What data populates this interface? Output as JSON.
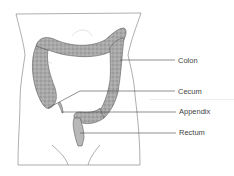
{
  "diagram": {
    "labels": [
      {
        "id": "colon",
        "text": "Colon",
        "x": 178,
        "y": 57
      },
      {
        "id": "cecum",
        "text": "Cecum",
        "x": 178,
        "y": 88
      },
      {
        "id": "appendix",
        "text": "Appendix",
        "x": 179,
        "y": 108
      },
      {
        "id": "rectum",
        "text": "Rectum",
        "x": 179,
        "y": 129
      }
    ],
    "colors": {
      "outline": "#777777",
      "intestine_fill": "#a9a9a9",
      "intestine_stroke": "#5e5e5e",
      "leader_line": "#444444",
      "label_text": "#444444"
    }
  }
}
